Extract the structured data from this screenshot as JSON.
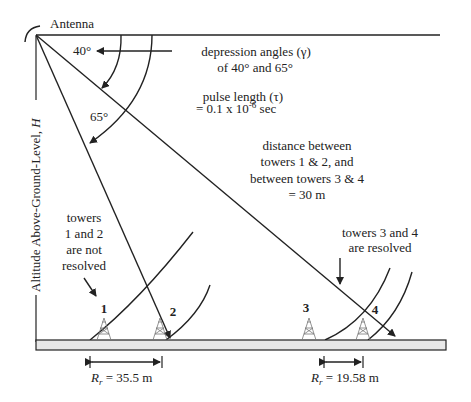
{
  "diagram": {
    "antenna_label": "Antenna",
    "axis_label": "Altitude Above-Ground-Level,",
    "axis_label_var": "H",
    "angle_40": "40°",
    "angle_65": "65°",
    "depression": {
      "line1": "depression angles (γ)",
      "line2": "of 40° and 65°"
    },
    "pulse": {
      "line1": "pulse length (τ)",
      "line2_pre": "= 0.1 x 10",
      "line2_exp": "-6",
      "line2_post": " sec"
    },
    "distance": {
      "line1": "distance between",
      "line2": "towers 1 & 2, and",
      "line3": "between towers 3 & 4",
      "line4": "= 30 m"
    },
    "not_resolved": {
      "line1": "towers",
      "line2": "1 and 2",
      "line3": "are not",
      "line4": "resolved"
    },
    "resolved": {
      "line1": "towers 3 and 4",
      "line2": "are resolved"
    },
    "towers": [
      {
        "label": "1"
      },
      {
        "label": "2"
      },
      {
        "label": "3"
      },
      {
        "label": "4"
      }
    ],
    "range_left": {
      "var": "R",
      "sub": "r",
      "value": " = 35.5 m"
    },
    "range_right": {
      "var": "R",
      "sub": "r",
      "value": " = 19.58 m"
    },
    "colors": {
      "line": "#222222",
      "ground_fill": "#e8e8e8"
    }
  }
}
